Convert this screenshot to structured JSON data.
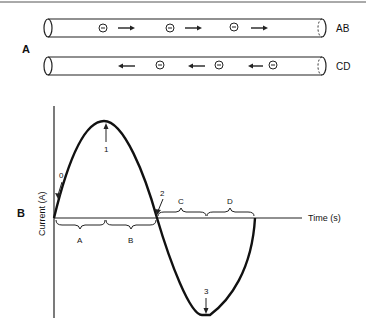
{
  "panel_a": {
    "label": "A",
    "tubes": [
      {
        "name": "AB",
        "direction": "right",
        "electron_symbol": "⊖",
        "electron_count": 3
      },
      {
        "name": "CD",
        "direction": "left",
        "electron_symbol": "⊖",
        "electron_count": 3
      }
    ]
  },
  "panel_b": {
    "label": "B",
    "y_axis_label": "Current (A)",
    "x_axis_label": "Time (s)",
    "points": [
      "0",
      "1",
      "2",
      "3"
    ],
    "intervals_above": [
      "A",
      "B"
    ],
    "intervals_below": [
      "C",
      "D"
    ]
  }
}
